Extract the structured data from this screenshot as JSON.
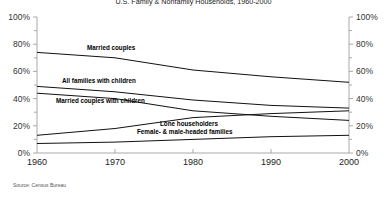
{
  "title": "U.S. Family & Nonfamily Households, 1960-2000",
  "source": "Source: Census Bureau",
  "chart_data": {
    "type": "line",
    "title": "U.S. Family & Nonfamily Households, 1960-2000",
    "x": [
      1960,
      1970,
      1980,
      1990,
      2000
    ],
    "x_tick_labels": [
      "1960",
      "1970",
      "1980",
      "1990",
      "2000"
    ],
    "ylim": [
      0,
      100
    ],
    "y_tick_interval": 20,
    "y_minor_tick_interval": 10,
    "y_tick_labels": [
      "0%",
      "20%",
      "40%",
      "60%",
      "80%",
      "100%"
    ],
    "y_axis_labeled_both_sides": true,
    "grid": false,
    "legend_position": "inline-labels",
    "line_color": "#111111",
    "axis_color": "#a9a9a9",
    "series": [
      {
        "name": "Married couples",
        "values": [
          74,
          70,
          61,
          56,
          52
        ]
      },
      {
        "name": "All families with children",
        "values": [
          49,
          45,
          39,
          35,
          33
        ]
      },
      {
        "name": "Married couples with children",
        "values": [
          44,
          40,
          31,
          27,
          24
        ]
      },
      {
        "name": "Lone householders",
        "values": [
          13,
          18,
          26,
          29,
          31
        ]
      },
      {
        "name": "Female- & male-headed families",
        "values": [
          7,
          8,
          10,
          12,
          13
        ]
      }
    ],
    "source": "Source: Census Bureau"
  }
}
